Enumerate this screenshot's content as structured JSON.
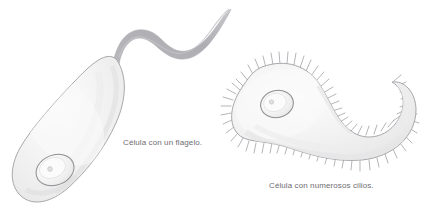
{
  "figure": {
    "background_color": "#ffffff",
    "width": 435,
    "height": 218,
    "title": "",
    "cell_fill_color": "#f2f2f2",
    "cell_outline_color": "#9a9a9e",
    "nucleus_outline_color": "#8e8e93",
    "cilia_color": "#a8a8ad",
    "flagellum_color": "#b3b3b8",
    "caption_color": "#6e6e72"
  },
  "captions": {
    "flagellum": "Célula con un flagelo.",
    "cilia": "Célula con numerosos cilios."
  },
  "structures": {
    "flagellated_cell": {
      "label": "flagellated-cell",
      "organelles": [
        "nucleus",
        "nucleolus",
        "flagellum",
        "cell-membrane"
      ]
    },
    "ciliated_cell": {
      "label": "ciliated-cell",
      "organelles": [
        "nucleus",
        "nucleolus",
        "cilia",
        "cell-membrane"
      ]
    }
  }
}
